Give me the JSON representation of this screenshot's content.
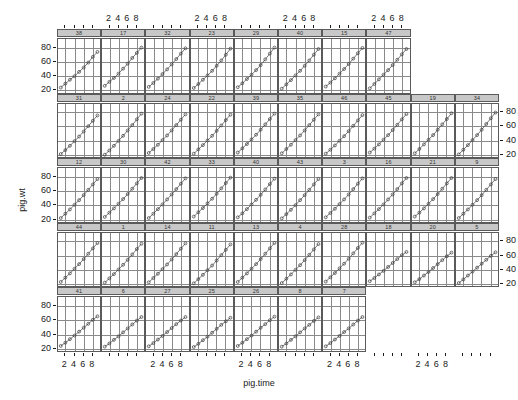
{
  "chart_data": {
    "type": "line",
    "title": "",
    "xlabel": "pig.time",
    "ylabel": "pig.wt",
    "xlim": [
      0.4,
      9.6
    ],
    "ylim": [
      17,
      92
    ],
    "xticks": [
      2,
      4,
      6,
      8
    ],
    "xticklabels": [
      "2",
      "4",
      "6",
      "8"
    ],
    "yticks": [
      20,
      40,
      60,
      80
    ],
    "yticklabels": [
      "20",
      "40",
      "60",
      "80"
    ],
    "grid": true,
    "legend": false,
    "conditioning_variable": "pig",
    "panels_per_row": [
      8,
      10,
      10,
      10,
      10
    ],
    "marker": "open-circle",
    "x": [
      1,
      2,
      3,
      4,
      5,
      6,
      7,
      8,
      9
    ],
    "panels": [
      {
        "strip": "38",
        "values": [
          24.0,
          29.5,
          35.0,
          40.0,
          46.0,
          52.0,
          59.0,
          67.0,
          74.0
        ]
      },
      {
        "strip": "17",
        "values": [
          26.5,
          32.0,
          37.5,
          43.5,
          50.5,
          57.5,
          65.5,
          72.5,
          80.0
        ]
      },
      {
        "strip": "32",
        "values": [
          25.0,
          30.5,
          36.5,
          43.0,
          49.5,
          56.5,
          64.0,
          71.5,
          79.0
        ]
      },
      {
        "strip": "23",
        "values": [
          23.5,
          29.0,
          35.0,
          41.0,
          47.5,
          54.5,
          62.0,
          70.0,
          78.5
        ]
      },
      {
        "strip": "29",
        "values": [
          24.5,
          30.0,
          36.0,
          42.0,
          48.5,
          55.5,
          63.5,
          71.5,
          80.0
        ]
      },
      {
        "strip": "40",
        "values": [
          22.5,
          28.5,
          34.5,
          41.0,
          47.5,
          54.5,
          62.0,
          70.0,
          78.0
        ]
      },
      {
        "strip": "15",
        "values": [
          25.5,
          31.0,
          37.0,
          43.5,
          50.0,
          57.0,
          64.5,
          72.0,
          79.5
        ]
      },
      {
        "strip": "47",
        "values": [
          23.0,
          29.0,
          35.5,
          42.0,
          48.5,
          55.5,
          63.0,
          70.5,
          78.0
        ]
      },
      {
        "strip": "31",
        "values": [
          22.0,
          27.5,
          33.5,
          40.0,
          46.5,
          53.5,
          61.0,
          68.5,
          76.0
        ]
      },
      {
        "strip": "2",
        "values": [
          21.0,
          27.0,
          33.5,
          40.5,
          47.5,
          55.0,
          62.5,
          70.5,
          78.5
        ]
      },
      {
        "strip": "24",
        "values": [
          23.5,
          29.0,
          35.0,
          41.5,
          48.0,
          55.0,
          62.5,
          70.0,
          77.5
        ]
      },
      {
        "strip": "22",
        "values": [
          22.5,
          28.5,
          34.5,
          41.0,
          47.5,
          54.5,
          62.0,
          69.5,
          77.0
        ]
      },
      {
        "strip": "39",
        "values": [
          24.0,
          30.0,
          36.0,
          42.5,
          49.0,
          56.0,
          63.5,
          71.0,
          78.5
        ]
      },
      {
        "strip": "35",
        "values": [
          23.0,
          29.0,
          35.0,
          41.5,
          48.0,
          55.0,
          62.5,
          70.0,
          77.5
        ]
      },
      {
        "strip": "46",
        "values": [
          22.5,
          28.0,
          34.0,
          40.5,
          47.0,
          54.0,
          61.5,
          69.0,
          76.5
        ]
      },
      {
        "strip": "45",
        "values": [
          24.0,
          29.5,
          35.5,
          42.0,
          48.5,
          55.5,
          63.0,
          70.5,
          78.0
        ]
      },
      {
        "strip": "19",
        "values": [
          23.0,
          29.0,
          35.5,
          42.0,
          48.5,
          56.0,
          63.5,
          71.0,
          79.0
        ]
      },
      {
        "strip": "34",
        "values": [
          21.5,
          28.0,
          34.5,
          41.5,
          48.5,
          56.0,
          64.0,
          72.0,
          80.0
        ]
      },
      {
        "strip": "12",
        "values": [
          22.0,
          28.0,
          34.0,
          40.5,
          47.0,
          54.0,
          61.5,
          69.0,
          76.5
        ]
      },
      {
        "strip": "30",
        "values": [
          23.5,
          29.5,
          35.5,
          42.0,
          48.5,
          55.5,
          63.0,
          70.5,
          78.0
        ]
      },
      {
        "strip": "42",
        "values": [
          22.0,
          28.0,
          34.5,
          41.0,
          48.0,
          55.0,
          62.5,
          70.0,
          77.5
        ]
      },
      {
        "strip": "33",
        "values": [
          24.0,
          30.0,
          36.0,
          42.5,
          49.0,
          56.0,
          63.5,
          71.0,
          78.5
        ]
      },
      {
        "strip": "40",
        "values": [
          23.0,
          28.5,
          34.5,
          41.0,
          47.5,
          54.5,
          62.0,
          69.5,
          77.0
        ]
      },
      {
        "strip": "43",
        "values": [
          21.5,
          27.5,
          33.5,
          40.0,
          47.0,
          54.0,
          61.5,
          69.0,
          76.5
        ]
      },
      {
        "strip": "3",
        "values": [
          23.0,
          29.0,
          35.0,
          41.5,
          48.0,
          55.0,
          62.5,
          70.0,
          77.5
        ]
      },
      {
        "strip": "16",
        "values": [
          22.5,
          28.5,
          34.5,
          41.0,
          48.0,
          55.0,
          62.5,
          70.5,
          78.0
        ]
      },
      {
        "strip": "21",
        "values": [
          24.0,
          29.5,
          35.5,
          42.0,
          48.5,
          55.5,
          63.0,
          70.5,
          78.0
        ]
      },
      {
        "strip": "9",
        "values": [
          22.0,
          28.0,
          34.0,
          40.5,
          47.0,
          54.0,
          61.5,
          69.0,
          76.5
        ]
      },
      {
        "strip": "44",
        "values": [
          23.5,
          29.5,
          35.5,
          42.0,
          48.5,
          55.5,
          63.0,
          70.5,
          78.0
        ]
      },
      {
        "strip": "1",
        "values": [
          22.5,
          28.5,
          34.5,
          41.0,
          47.5,
          54.5,
          62.0,
          69.5,
          77.0
        ]
      },
      {
        "strip": "14",
        "values": [
          23.0,
          29.0,
          35.0,
          41.5,
          48.0,
          55.0,
          62.5,
          70.0,
          77.5
        ]
      },
      {
        "strip": "11",
        "values": [
          21.5,
          27.5,
          33.5,
          40.0,
          46.5,
          53.5,
          61.0,
          68.5,
          76.0
        ]
      },
      {
        "strip": "13",
        "values": [
          23.5,
          29.5,
          35.5,
          42.0,
          48.5,
          55.5,
          63.0,
          70.5,
          78.0
        ]
      },
      {
        "strip": "4",
        "values": [
          22.0,
          28.0,
          34.0,
          40.5,
          47.0,
          54.0,
          61.5,
          69.0,
          76.5
        ]
      },
      {
        "strip": "28",
        "values": [
          24.0,
          30.0,
          36.0,
          42.5,
          49.0,
          56.0,
          63.5,
          71.0,
          78.5
        ]
      },
      {
        "strip": "18",
        "values": [
          24.5,
          29.0,
          34.0,
          39.0,
          44.5,
          50.0,
          55.5,
          61.0,
          65.5
        ]
      },
      {
        "strip": "20",
        "values": [
          23.0,
          27.5,
          32.5,
          37.5,
          43.0,
          48.5,
          54.0,
          59.5,
          64.5
        ]
      },
      {
        "strip": "5",
        "values": [
          22.0,
          27.0,
          32.5,
          38.0,
          43.5,
          49.0,
          54.5,
          60.0,
          65.0
        ]
      },
      {
        "strip": "41",
        "values": [
          23.5,
          28.0,
          33.0,
          38.0,
          43.5,
          49.0,
          54.5,
          60.0,
          65.0
        ]
      },
      {
        "strip": "6",
        "values": [
          22.5,
          27.0,
          32.0,
          37.0,
          42.5,
          48.0,
          53.5,
          59.0,
          64.0
        ]
      },
      {
        "strip": "27",
        "values": [
          23.0,
          27.5,
          32.5,
          37.5,
          43.0,
          48.5,
          54.0,
          59.0,
          64.0
        ]
      },
      {
        "strip": "25",
        "values": [
          22.0,
          26.5,
          31.5,
          36.5,
          42.0,
          47.5,
          53.0,
          58.0,
          63.0
        ]
      },
      {
        "strip": "26",
        "values": [
          23.5,
          28.0,
          33.0,
          38.0,
          43.5,
          49.0,
          54.0,
          59.5,
          64.5
        ]
      },
      {
        "strip": "8",
        "values": [
          22.5,
          27.0,
          32.0,
          37.0,
          42.5,
          48.0,
          53.0,
          58.5,
          63.5
        ]
      },
      {
        "strip": "7",
        "values": [
          23.0,
          27.5,
          32.5,
          37.5,
          43.0,
          48.0,
          53.5,
          59.0,
          64.0
        ]
      }
    ]
  }
}
